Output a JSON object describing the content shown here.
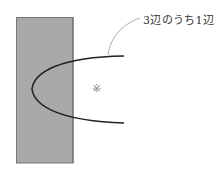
{
  "diagram": {
    "label": "3辺のうち1辺",
    "mark": "※",
    "colors": {
      "rect_fill": "#a9a9a9",
      "rect_border": "#777777",
      "curve": "#222222",
      "leader": "#888888"
    }
  }
}
